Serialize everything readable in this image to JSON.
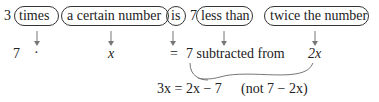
{
  "phrase": {
    "n3": "3",
    "times": "times",
    "certain": "a certain number",
    "is": "is",
    "n7": "7",
    "less": "less than",
    "twice": "twice the number"
  },
  "translation": {
    "seven": "7",
    "dot": "·",
    "x": "x",
    "eq": "=",
    "sub": "7 subtracted from",
    "twox": "2x"
  },
  "equation": {
    "main": "3x = 2x − 7",
    "note": "(not 7 − 2x)"
  }
}
